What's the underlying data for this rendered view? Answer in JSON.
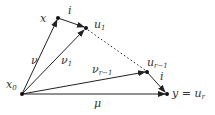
{
  "diagram": {
    "nodes": {
      "x0": {
        "label": "x",
        "sub": "0"
      },
      "x": {
        "label": "x"
      },
      "u1": {
        "label": "u",
        "sub": "1"
      },
      "ur1": {
        "label": "u",
        "sub": "r−1"
      },
      "y": {
        "label": "y = u",
        "sub": "r"
      }
    },
    "edges": {
      "nu": {
        "label": "ν"
      },
      "nu1": {
        "label": "ν",
        "sub": "1"
      },
      "nur1": {
        "label": "ν",
        "sub": "r−1"
      },
      "mu": {
        "label": "μ"
      },
      "i_top": {
        "label": "i"
      },
      "i_bottom": {
        "label": "i"
      }
    }
  }
}
